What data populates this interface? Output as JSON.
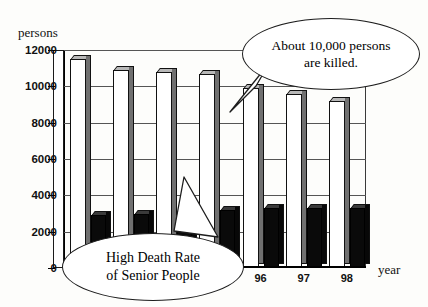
{
  "chart_data": {
    "type": "bar",
    "title": "",
    "subtitle": "",
    "xlabel": "year",
    "ylabel": "persons",
    "ylim": [
      0,
      12000
    ],
    "ytick_values": [
      0,
      2000,
      4000,
      6000,
      8000,
      10000,
      12000
    ],
    "ytick_labels": [
      "0",
      "2000",
      "4000",
      "6000",
      "8000",
      "10000",
      "12000"
    ],
    "grid": true,
    "legend": "none",
    "categories": [
      "92",
      "93",
      "94",
      "95",
      "96",
      "97",
      "98"
    ],
    "xtick_labels_visible": [
      "92",
      "96",
      "97",
      "98"
    ],
    "series": [
      {
        "name": "total-deaths",
        "style": "light",
        "values": [
          11500,
          10900,
          10800,
          10700,
          9900,
          9600,
          9200
        ]
      },
      {
        "name": "senior-deaths",
        "style": "dark",
        "values": [
          2900,
          3000,
          3100,
          3200,
          3300,
          3300,
          3300
        ]
      }
    ],
    "annotations": [
      {
        "id": "about-10000",
        "text": "About 10,000 persons are killed.",
        "line1": "About 10,000 persons",
        "line2": "are killed.",
        "points_at": "96"
      },
      {
        "id": "high-death-rate",
        "text": "High Death Rate of Senior People",
        "line1": "High Death Rate",
        "line2": "of Senior People",
        "points_at": "95-dark-bar"
      }
    ]
  },
  "axes": {
    "y_title": "persons",
    "x_title": "year"
  },
  "colors": {
    "background": "#fdfdfb",
    "bar_light": "#ffffff",
    "bar_light_side": "#707070",
    "bar_dark": "#0a0a0a",
    "axis": "#000000",
    "grid": "#555555",
    "bubble_border": "#1d1d1d"
  },
  "bubbles": {
    "top": {
      "line1": "About 10,000 persons",
      "line2": "are killed."
    },
    "bottom": {
      "line1": "High Death Rate",
      "line2": "of Senior People"
    }
  }
}
